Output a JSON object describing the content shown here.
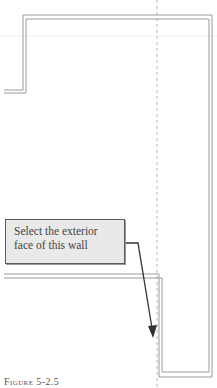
{
  "figure": {
    "caption": "Figure 5-2.5",
    "callout": {
      "line1": "Select the exterior",
      "line2": "face of this wall"
    },
    "colors": {
      "wall_line": "#9a9a9a",
      "guide_line": "#b8b8b8",
      "faint_guide": "#ececec",
      "arrow": "#333333",
      "callout_fill": "#e9e9e9",
      "callout_border": "#5a5a5a"
    }
  }
}
